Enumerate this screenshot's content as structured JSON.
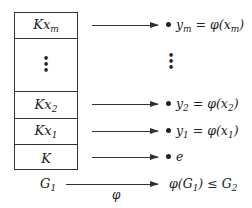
{
  "diagram": {
    "box_cells": [
      {
        "label": "Kx",
        "sub": "m"
      },
      {
        "label": "⋮",
        "sub": ""
      },
      {
        "label": "Kx",
        "sub": "2"
      },
      {
        "label": "Kx",
        "sub": "1"
      },
      {
        "label": "K",
        "sub": ""
      }
    ],
    "group_label": {
      "label": "G",
      "sub": "1"
    },
    "map_label": "φ",
    "images": [
      {
        "pre": "y",
        "sub": "m",
        "mid": " = φ(x",
        "sub2": "m",
        "post": ")"
      },
      {
        "pre": "⋮"
      },
      {
        "pre": "y",
        "sub": "2",
        "mid": " = φ(x",
        "sub2": "2",
        "post": ")"
      },
      {
        "pre": "y",
        "sub": "1",
        "mid": " = φ(x",
        "sub2": "1",
        "post": ")"
      },
      {
        "pre": "e"
      }
    ],
    "codomain": {
      "pre": "φ(G",
      "sub": "1",
      "post": ") ≤ G",
      "sub2": "2"
    }
  }
}
